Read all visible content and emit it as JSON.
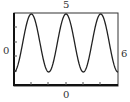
{
  "labels": {
    "top": "5",
    "left": "0",
    "right": "6",
    "bottom": "0"
  },
  "chart_data": {
    "type": "line",
    "title": "",
    "xlabel": "",
    "ylabel": "",
    "annotations": {
      "top": "5",
      "left": "0",
      "right": "6",
      "bottom": "0"
    },
    "xlim": [
      0,
      6
    ],
    "ylim": [
      0,
      5
    ],
    "grid": false,
    "series": [
      {
        "name": "periodic curve",
        "description": "sinusoid with period 2, 3 full oscillations across window",
        "x": [
          0,
          0.33,
          0.67,
          1,
          1.33,
          1.67,
          2,
          2.33,
          2.67,
          3,
          3.33,
          3.67,
          4,
          4.33,
          4.67,
          5,
          5.33,
          5.67,
          6
        ],
        "y": [
          0.8,
          2.9,
          4.9,
          2.9,
          0.8,
          2.9,
          4.9,
          2.9,
          0.8,
          2.9,
          4.9,
          2.9,
          0.8,
          2.9,
          4.9,
          2.9,
          0.8,
          2.9,
          0.8
        ]
      }
    ],
    "color": "#222222"
  }
}
